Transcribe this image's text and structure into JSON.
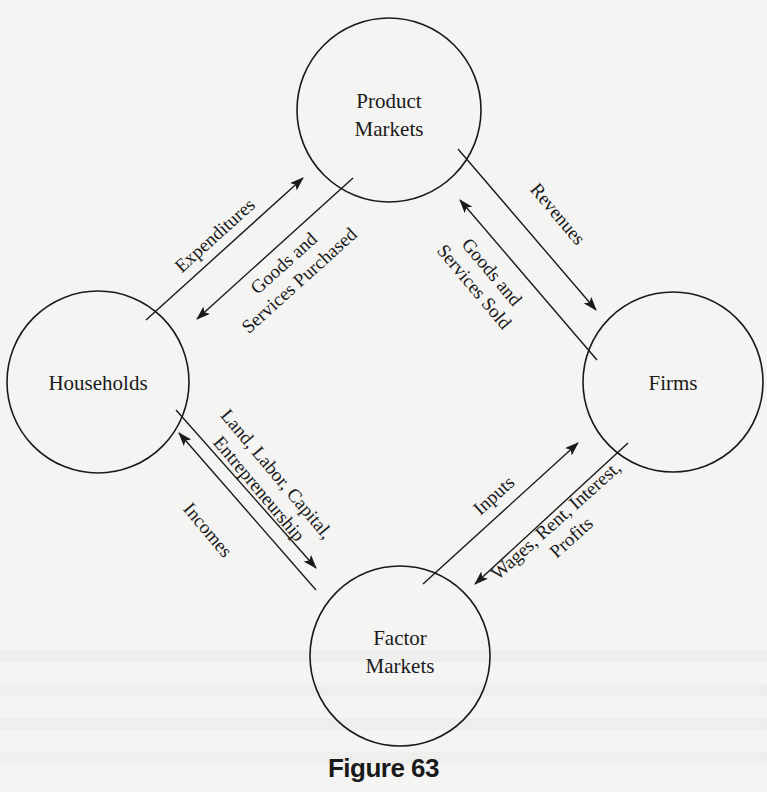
{
  "nodes": {
    "product_markets": {
      "line1": "Product",
      "line2": "Markets"
    },
    "households": {
      "label": "Households"
    },
    "firms": {
      "label": "Firms"
    },
    "factor_markets": {
      "line1": "Factor",
      "line2": "Markets"
    }
  },
  "flows": {
    "expenditures": {
      "label": "Expenditures"
    },
    "goods_purchased": {
      "line1": "Goods and",
      "line2": "Services Purchased"
    },
    "revenues": {
      "label": "Revenues"
    },
    "goods_sold": {
      "line1": "Goods and",
      "line2": "Services Sold"
    },
    "land_labor": {
      "line1": "Land, Labor, Capital,",
      "line2": "Entrepreneurship"
    },
    "incomes": {
      "label": "Incomes"
    },
    "inputs": {
      "label": "Inputs"
    },
    "wages": {
      "line1": "Wages, Rent, Interest,",
      "line2": "Profits"
    }
  },
  "caption": "Figure 63"
}
